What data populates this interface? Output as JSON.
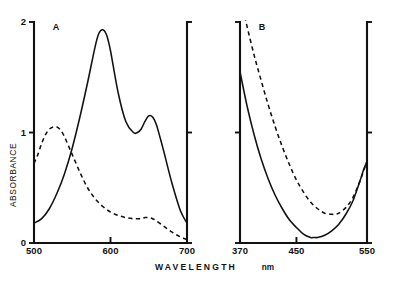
{
  "figure": {
    "background_color": "#ffffff",
    "ink_color": "#111111",
    "y_axis_title": "ABSORBANCE",
    "x_axis_title": "WAVELENGTH",
    "x_axis_unit": "nm"
  },
  "panels": [
    {
      "label": "A",
      "x_ticks": [
        "500",
        "600",
        "700"
      ],
      "x_tick_values": [
        500,
        600,
        700
      ],
      "y_ticks": [
        "0",
        "1",
        "2"
      ],
      "y_tick_values": [
        0,
        1,
        2
      ]
    },
    {
      "label": "B",
      "x_ticks": [
        "370",
        "450",
        "550"
      ],
      "x_tick_values": [
        370,
        450,
        550
      ],
      "y_ticks": [
        "",
        "",
        ""
      ],
      "y_tick_values": [
        0,
        1,
        2
      ]
    }
  ],
  "chart_data": [
    {
      "type": "line",
      "title": "A",
      "xlabel": "WAVELENGTH (nm)",
      "ylabel": "ABSORBANCE",
      "xlim": [
        500,
        700
      ],
      "ylim": [
        0,
        2
      ],
      "grid": false,
      "legend": null,
      "xticks": [
        500,
        600,
        700
      ],
      "yticks": [
        0,
        1,
        2
      ],
      "series": [
        {
          "name": "solid curve",
          "style": "solid",
          "x": [
            500,
            510,
            520,
            530,
            540,
            550,
            560,
            570,
            580,
            585,
            590,
            595,
            600,
            610,
            620,
            630,
            635,
            640,
            645,
            650,
            655,
            660,
            665,
            670,
            680,
            690,
            695,
            700
          ],
          "y": [
            0.18,
            0.22,
            0.31,
            0.45,
            0.63,
            0.86,
            1.14,
            1.45,
            1.78,
            1.9,
            1.93,
            1.88,
            1.74,
            1.36,
            1.1,
            1.0,
            1.0,
            1.03,
            1.1,
            1.15,
            1.14,
            1.07,
            0.95,
            0.82,
            0.55,
            0.32,
            0.24,
            0.18
          ]
        },
        {
          "name": "dashed curve",
          "style": "dashed",
          "x": [
            500,
            505,
            510,
            515,
            520,
            525,
            530,
            535,
            540,
            545,
            550,
            560,
            570,
            580,
            590,
            600,
            610,
            620,
            630,
            640,
            645,
            650,
            655,
            660,
            670,
            680,
            690,
            700
          ],
          "y": [
            0.72,
            0.8,
            0.9,
            0.98,
            1.03,
            1.05,
            1.05,
            1.02,
            0.96,
            0.88,
            0.8,
            0.64,
            0.5,
            0.4,
            0.33,
            0.28,
            0.25,
            0.23,
            0.22,
            0.22,
            0.23,
            0.23,
            0.22,
            0.2,
            0.15,
            0.1,
            0.06,
            0.03
          ]
        }
      ]
    },
    {
      "type": "line",
      "title": "B",
      "xlabel": "WAVELENGTH (nm)",
      "ylabel": "ABSORBANCE",
      "xlim": [
        370,
        550
      ],
      "ylim": [
        0,
        2
      ],
      "grid": false,
      "legend": null,
      "xticks": [
        370,
        450,
        550
      ],
      "yticks": [
        0,
        1,
        2
      ],
      "series": [
        {
          "name": "solid curve",
          "style": "solid",
          "x": [
            370,
            380,
            390,
            400,
            410,
            420,
            430,
            440,
            450,
            460,
            470,
            475,
            480,
            490,
            500,
            510,
            520,
            530,
            540,
            545,
            550
          ],
          "y": [
            1.55,
            1.24,
            0.98,
            0.76,
            0.58,
            0.43,
            0.31,
            0.21,
            0.14,
            0.08,
            0.05,
            0.05,
            0.05,
            0.07,
            0.11,
            0.17,
            0.26,
            0.38,
            0.56,
            0.66,
            0.74
          ]
        },
        {
          "name": "dashed curve",
          "style": "dashed",
          "x": [
            370,
            375,
            380,
            390,
            400,
            410,
            420,
            430,
            440,
            450,
            460,
            470,
            480,
            490,
            500,
            505,
            510,
            520,
            530,
            540,
            545,
            550
          ],
          "y": [
            2.25,
            2.1,
            1.96,
            1.7,
            1.47,
            1.25,
            1.05,
            0.87,
            0.71,
            0.57,
            0.46,
            0.37,
            0.31,
            0.27,
            0.26,
            0.26,
            0.27,
            0.32,
            0.41,
            0.56,
            0.65,
            0.74
          ]
        }
      ]
    }
  ]
}
